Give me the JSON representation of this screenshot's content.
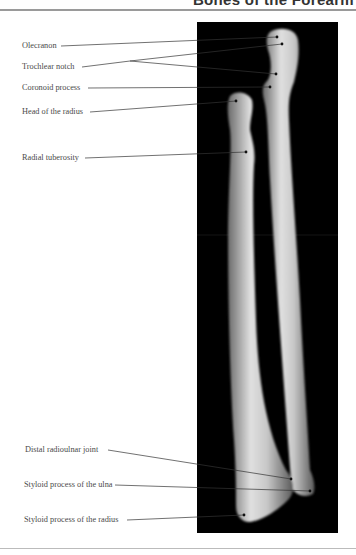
{
  "header": {
    "title": "Bones of the Forearm"
  },
  "figure": {
    "panel_color": "#000000",
    "bone_color": "#d8d8d8",
    "labels": [
      {
        "text": "Olecranon",
        "x": 22,
        "y": 41
      },
      {
        "text": "Trochlear notch",
        "x": 22,
        "y": 62
      },
      {
        "text": "Coronoid process",
        "x": 22,
        "y": 84
      },
      {
        "text": "Head of the radius",
        "x": 22,
        "y": 106
      },
      {
        "text": "Radial tuberosity",
        "x": 22,
        "y": 152
      },
      {
        "text": "Distal radioulnar joint",
        "x": 25,
        "y": 445
      },
      {
        "text": "Styloid process of the ulna",
        "x": 24,
        "y": 480
      },
      {
        "text": "Styloid process of the radius",
        "x": 24,
        "y": 515
      }
    ]
  }
}
